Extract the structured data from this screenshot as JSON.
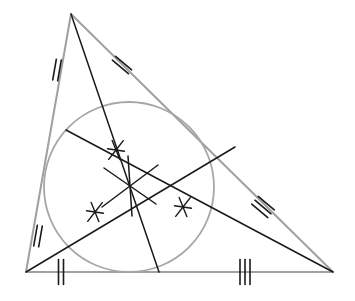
{
  "figure": {
    "width": 355,
    "height": 301,
    "background_color": "#ffffff"
  },
  "colors": {
    "triangle_stroke": "#a0a0a0",
    "circle_stroke": "#a6a6a6",
    "cevian_stroke": "#1a1a1a",
    "tick_stroke": "#1a1a1a",
    "star_stroke": "#1a1a1a",
    "background": "#ffffff"
  },
  "strokes": {
    "triangle_width": 2.0,
    "circle_width": 1.8,
    "cevian_width": 1.5,
    "tick_width": 1.6,
    "star_width": 1.4
  },
  "triangle": {
    "name": "main-triangle",
    "vertices": [
      {
        "label": "apex",
        "x": 71,
        "y": 14
      },
      {
        "label": "bottom-left",
        "x": 26,
        "y": 272
      },
      {
        "label": "bottom-right",
        "x": 333,
        "y": 272
      }
    ],
    "sides": [
      {
        "name": "left-side",
        "from": 0,
        "to": 1
      },
      {
        "name": "bottom-side",
        "from": 1,
        "to": 2
      },
      {
        "name": "right-side",
        "from": 0,
        "to": 2
      }
    ]
  },
  "incircle": {
    "name": "inscribed-circle",
    "center_x": 129,
    "center_y": 187,
    "radius": 85
  },
  "incenter": {
    "name": "incenter-point",
    "x": 130,
    "y": 186
  },
  "cevians": [
    {
      "name": "bisector-from-apex",
      "from_x": 71,
      "from_y": 14,
      "to_x": 159,
      "to_y": 272
    },
    {
      "name": "bisector-from-bottom-left",
      "from_x": 26,
      "from_y": 272,
      "to_x": 235,
      "to_y": 147
    },
    {
      "name": "bisector-from-bottom-right",
      "from_x": 333,
      "from_y": 272,
      "to_x": 66,
      "to_y": 130
    }
  ],
  "side_ticks": [
    {
      "name": "tick-left-upper",
      "count": 2,
      "center_x": 57,
      "center_y": 70,
      "angle_deg": 99.9,
      "length": 21,
      "spacing": 5
    },
    {
      "name": "tick-right-upper",
      "count": 2,
      "center_x": 122,
      "center_y": 65,
      "angle_deg": 40.1,
      "length": 21,
      "spacing": 5
    },
    {
      "name": "tick-left-lower",
      "count": 2,
      "center_x": 38,
      "center_y": 236,
      "angle_deg": 99.9,
      "length": 21,
      "spacing": 5
    },
    {
      "name": "tick-right-lower",
      "count": 3,
      "center_x": 263,
      "center_y": 207,
      "angle_deg": 40.1,
      "length": 21,
      "spacing": 5
    },
    {
      "name": "tick-bottom-left",
      "count": 2,
      "center_x": 61,
      "center_y": 272,
      "angle_deg": 90,
      "length": 25,
      "spacing": 5
    },
    {
      "name": "tick-bottom-right",
      "count": 3,
      "center_x": 245,
      "center_y": 272,
      "angle_deg": 90,
      "length": 25,
      "spacing": 5
    }
  ],
  "angle_marks": [
    {
      "name": "bisector-star-upper",
      "x": 116,
      "y": 150,
      "rays": 6,
      "radius": 11,
      "base_angle_deg": 8
    },
    {
      "name": "bisector-star-lower-left",
      "x": 95,
      "y": 212,
      "rays": 6,
      "radius": 11,
      "base_angle_deg": 8
    },
    {
      "name": "bisector-star-right",
      "x": 183,
      "y": 207,
      "rays": 6,
      "radius": 11,
      "base_angle_deg": 8
    }
  ],
  "incenter_cross": {
    "name": "incenter-cross-mark",
    "x": 130,
    "y": 186,
    "arms": [
      {
        "dx": -26,
        "dy": -18
      },
      {
        "dx": 26,
        "dy": 18
      },
      {
        "dx": 28,
        "dy": -21
      },
      {
        "dx": -28,
        "dy": 21
      },
      {
        "dx": 2,
        "dy": 30
      },
      {
        "dx": -2,
        "dy": -30
      }
    ]
  }
}
